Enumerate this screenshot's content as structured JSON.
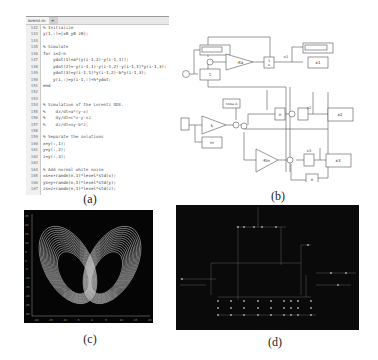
{
  "figure": {
    "captions": {
      "a": "(a)",
      "b": "(b)",
      "c": "(c)",
      "d": "(d)"
    }
  },
  "code_editor": {
    "tabs": [
      {
        "label": "lorenz.m",
        "close": "×"
      },
      {
        "label": "+"
      }
    ],
    "line_numbers": [
      "142",
      "143",
      "144",
      "145",
      "146",
      "147",
      "148",
      "149",
      "150",
      "151",
      "152",
      "153",
      "154",
      "155",
      "156",
      "157",
      "158",
      "159",
      "160",
      "161",
      "162",
      "163",
      "164",
      "165",
      "166",
      "167"
    ],
    "lines": [
      {
        "text": "% Initialize",
        "type": "comment"
      },
      {
        "text": "y(1,:)=[x0 y0 z0];",
        "type": "code"
      },
      {
        "text": "",
        "type": "code"
      },
      {
        "text": "% Simulate",
        "type": "comment"
      },
      {
        "text": "for i=2:n",
        "type": "code"
      },
      {
        "text": "    ydot(1)=a*(y(i-1,2)-y(i-1,1));",
        "type": "code"
      },
      {
        "text": "    ydot(2)=-y(i-1,1)-y(i-1,2)-y(i-1,1)*y(i-1,3);",
        "type": "code"
      },
      {
        "text": "    ydot(3)=y(i-1,1)*y(i-1,2)-b*y(i-1,3);",
        "type": "code"
      },
      {
        "text": "    y(i,:)=y(i-1,:)+h*ydot;",
        "type": "code"
      },
      {
        "text": "end",
        "type": "code"
      },
      {
        "text": "",
        "type": "code"
      },
      {
        "text": "",
        "type": "code"
      },
      {
        "text": "% Simulation of the Lorentz ODE.",
        "type": "comment"
      },
      {
        "text": "%    dx/dt=a*(y-x)",
        "type": "comment"
      },
      {
        "text": "%    dy/dt=c*x-y-xz",
        "type": "comment"
      },
      {
        "text": "%    dz/dt=xy-b*z;",
        "type": "comment"
      },
      {
        "text": "",
        "type": "code"
      },
      {
        "text": "% Separate the solutions",
        "type": "comment"
      },
      {
        "text": "x=y(:,1);",
        "type": "code"
      },
      {
        "text": "y=y(:,2);",
        "type": "code"
      },
      {
        "text": "z=y(:,3);",
        "type": "code"
      },
      {
        "text": "",
        "type": "code"
      },
      {
        "text": "% Add normal white noise",
        "type": "comment"
      },
      {
        "text": "xs=x+randn(n,1)*level*std(x);",
        "type": "code"
      },
      {
        "text": "ys=y+randn(n,1)*level*std(y);",
        "type": "code"
      },
      {
        "text": "zs=z+randn(n,1)*level*std(z);",
        "type": "code"
      }
    ]
  },
  "simulink": {
    "blocks": {
      "clock": "",
      "display_top": "",
      "const_1": "1",
      "gain_a": "-Ka",
      "integrator": "1/s",
      "scope_x1": "x1",
      "display_x1": "",
      "signal_labels": [
        "x1",
        "x2",
        "x3"
      ],
      "step_block": "",
      "gain_k": "k",
      "const_m": "m",
      "noise_block": "noise A",
      "product_x": "×",
      "scope_x2": "x2",
      "gain_bm": "-Km",
      "scope_x3": "x3",
      "product_bottom": "×"
    }
  },
  "lorenz_plot": {
    "background": "#050505",
    "trace_color": "#e8e8e8",
    "y_ticks": [
      "25",
      "20",
      "15",
      "10",
      "5",
      "0",
      "-5",
      "-10",
      "-15",
      "-20",
      "-25",
      "-30"
    ],
    "x_ticks": [
      "-20",
      "-15",
      "-10",
      "-5",
      "0",
      "5",
      "10",
      "15",
      "20"
    ]
  },
  "circuit_view": {
    "background": "#0a0a0a",
    "trace_color": "#6a6a6a"
  }
}
